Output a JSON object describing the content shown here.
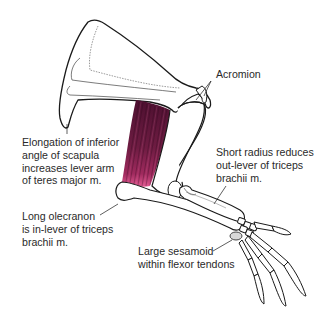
{
  "figure": {
    "colors": {
      "outline": "#1a1a1a",
      "bone_fill": "#ffffff",
      "muscle_dark": "#5a1433",
      "muscle_mid": "#7a1f48",
      "muscle_light": "#d9477f",
      "text": "#2a2a2a"
    }
  },
  "labels": {
    "acromion": {
      "lines": [
        "Acromion"
      ]
    },
    "scapula": {
      "lines": [
        "Elongation of inferior",
        "angle of scapula",
        "increases lever arm",
        "of teres major m."
      ]
    },
    "radius": {
      "lines": [
        "Short radius reduces",
        "out-lever of triceps",
        "brachii m."
      ]
    },
    "olecranon": {
      "lines": [
        "Long olecranon",
        "is in-lever of triceps",
        "brachii m."
      ]
    },
    "sesamoid": {
      "lines": [
        "Large sesamoid",
        "within flexor tendons"
      ]
    }
  }
}
